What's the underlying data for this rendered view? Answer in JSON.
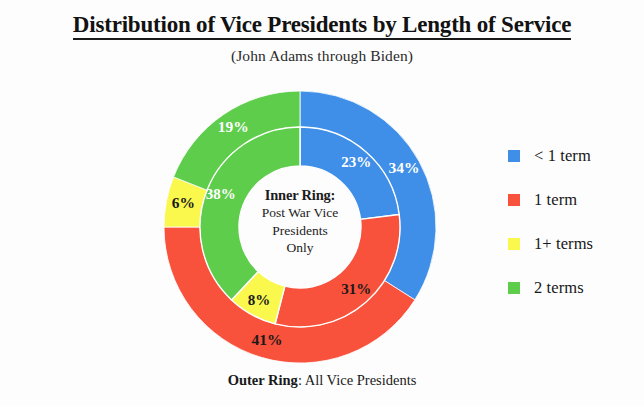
{
  "header": {
    "title": "Distribution of Vice Presidents by Length of Service",
    "subtitle": "(John Adams through Biden)"
  },
  "center_caption": {
    "heading": "Inner Ring:",
    "line1": "Post War Vice",
    "line2": "Presidents",
    "line3": "Only"
  },
  "outer_caption": {
    "heading": "Outer Ring",
    "rest": ": All Vice Presidents"
  },
  "legend": {
    "items": [
      {
        "label": "< 1 term",
        "color": "#3f8fe8"
      },
      {
        "label": "1 term",
        "color": "#f8513c"
      },
      {
        "label": "1+ terms",
        "color": "#faf84d"
      },
      {
        "label": "2 terms",
        "color": "#5dcd4b"
      }
    ]
  },
  "chart_data": {
    "type": "pie",
    "title": "Distribution of Vice Presidents by Length of Service",
    "subtitle": "(John Adams through Biden)",
    "legend_position": "right",
    "grid": false,
    "categories": [
      "< 1 term",
      "1 term",
      "1+ terms",
      "2 terms"
    ],
    "colors": [
      "#3f8fe8",
      "#f8513c",
      "#faf84d",
      "#5dcd4b"
    ],
    "rings": [
      {
        "name": "Outer Ring",
        "description": "All Vice Presidents",
        "position": "outer",
        "start_angle_deg": 0,
        "direction": "clockwise",
        "values": [
          34,
          41,
          6,
          19
        ],
        "labels": [
          "34%",
          "41%",
          "6%",
          "19%"
        ],
        "label_colors": [
          "#ffffff",
          "#1a1a1a",
          "#1a1a1a",
          "#ffffff"
        ]
      },
      {
        "name": "Inner Ring",
        "description": "Post War Vice Presidents Only",
        "position": "inner",
        "start_angle_deg": 0,
        "direction": "clockwise",
        "values": [
          23,
          31,
          8,
          38
        ],
        "labels": [
          "23%",
          "31%",
          "8%",
          "38%"
        ],
        "label_colors": [
          "#ffffff",
          "#1a1a1a",
          "#1a1a1a",
          "#ffffff"
        ]
      }
    ],
    "geometry": {
      "cx": 137,
      "cy": 137,
      "outer_radius": 136,
      "mid_radius": 100,
      "hole_radius": 61
    }
  }
}
